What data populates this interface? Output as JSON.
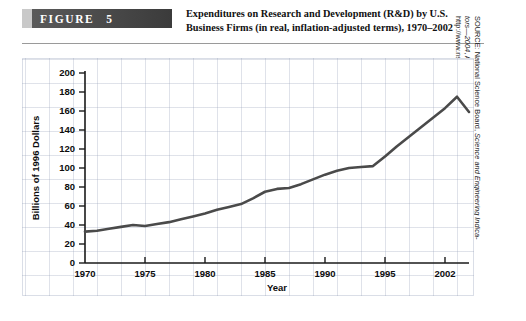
{
  "header": {
    "figure_label": "FIGURE",
    "figure_number": "5",
    "title_line1": "Expenditures on Research and Development (R&D) by U.S.",
    "title_line2": "Business Firms (in real, inflation-adjusted terms), 1970–2002"
  },
  "source": {
    "line1_prefix": "SOURCE: National Science Board, ",
    "line1_italic": "Science and Engineering Indica-",
    "line2_italic": "tors—2004",
    "line2_rest": ", Arlington, VA.: National Science Foundation, 2004,",
    "line3": "http://www.nsf.gov/."
  },
  "chart_data": {
    "type": "line",
    "title": "Expenditures on Research and Development (R&D) by U.S. Business Firms (in real, inflation-adjusted terms), 1970–2002",
    "xlabel": "Year",
    "ylabel": "Billions of 1996 Dollars",
    "xlim": [
      1970,
      2002
    ],
    "ylim": [
      0,
      200
    ],
    "grid": true,
    "legend": "none",
    "y_ticks": [
      0,
      20,
      40,
      60,
      80,
      100,
      120,
      140,
      160,
      180,
      200
    ],
    "y_tick_labels": [
      "0",
      "20",
      "40",
      "60",
      "80",
      "100",
      "120",
      "140",
      "160",
      "180",
      "200"
    ],
    "x_ticks": [
      1970,
      1975,
      1980,
      1985,
      1990,
      1995,
      2000
    ],
    "x_tick_labels": [
      "1970",
      "1975",
      "1980",
      "1985",
      "1990",
      "1995",
      "2002"
    ],
    "series": [
      {
        "name": "R&D expenditures by U.S. business firms",
        "color": "#4a4a4a",
        "x": [
          1970,
          1971,
          1972,
          1973,
          1974,
          1975,
          1976,
          1977,
          1978,
          1979,
          1980,
          1981,
          1982,
          1983,
          1984,
          1985,
          1986,
          1987,
          1988,
          1989,
          1990,
          1991,
          1992,
          1993,
          1994,
          1995,
          1996,
          1997,
          1998,
          1999,
          2000,
          2001,
          2002
        ],
        "y": [
          33,
          34,
          36,
          38,
          40,
          39,
          41,
          43,
          46,
          49,
          52,
          56,
          59,
          62,
          68,
          75,
          78,
          79,
          83,
          88,
          93,
          97,
          100,
          101,
          102,
          112,
          123,
          133,
          143,
          153,
          163,
          175,
          159
        ]
      }
    ]
  }
}
